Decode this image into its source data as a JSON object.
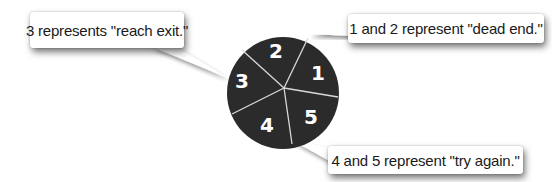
{
  "spinner": {
    "fill_color": "#2b2b2b",
    "divider_color": "#d8d8d8",
    "label_color": "#ffffff",
    "segments": [
      {
        "label": "1"
      },
      {
        "label": "2"
      },
      {
        "label": "3"
      },
      {
        "label": "4"
      },
      {
        "label": "5"
      }
    ]
  },
  "callouts": {
    "reach_exit": "3 represents \"reach exit.\"",
    "dead_end": "1 and 2 represent \"dead end.\"",
    "try_again": "4 and 5 represent \"try again.\""
  }
}
